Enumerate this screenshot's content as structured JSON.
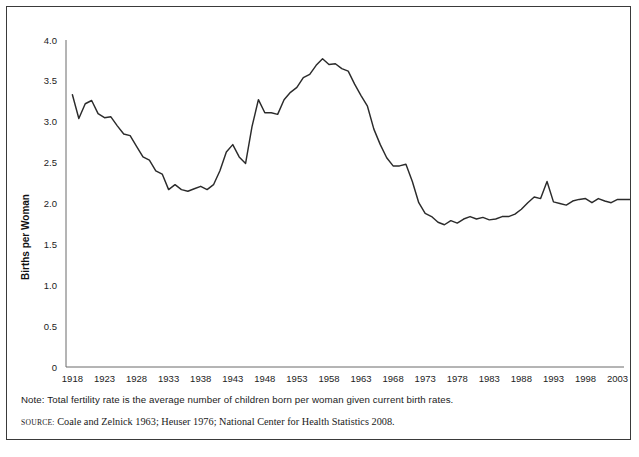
{
  "chart_data": {
    "type": "line",
    "title": "",
    "xlabel": "",
    "ylabel": "Births per Woman",
    "xlim": [
      1917,
      2004
    ],
    "ylim": [
      0,
      4.0
    ],
    "grid": false,
    "legend": "none",
    "y_ticks": [
      "0",
      "0.5",
      "1.0",
      "1.5",
      "2.0",
      "2.5",
      "3.0",
      "3.5",
      "4.0"
    ],
    "y_tick_values": [
      0,
      0.5,
      1.0,
      1.5,
      2.0,
      2.5,
      3.0,
      3.5,
      4.0
    ],
    "x_ticks": [
      "1918",
      "1923",
      "1928",
      "1933",
      "1938",
      "1943",
      "1948",
      "1953",
      "1958",
      "1963",
      "1968",
      "1973",
      "1978",
      "1983",
      "1988",
      "1993",
      "1998",
      "2003"
    ],
    "x_tick_values": [
      1918,
      1923,
      1928,
      1933,
      1938,
      1943,
      1948,
      1953,
      1958,
      1963,
      1968,
      1973,
      1978,
      1983,
      1988,
      1993,
      1998,
      2003
    ],
    "series": [
      {
        "name": "Total fertility rate",
        "color": "#2b2b2b",
        "x": [
          1918,
          1919,
          1920,
          1921,
          1922,
          1923,
          1924,
          1925,
          1926,
          1927,
          1928,
          1929,
          1930,
          1931,
          1932,
          1933,
          1934,
          1935,
          1936,
          1937,
          1938,
          1939,
          1940,
          1941,
          1942,
          1943,
          1944,
          1945,
          1946,
          1947,
          1948,
          1949,
          1950,
          1951,
          1952,
          1953,
          1954,
          1955,
          1956,
          1957,
          1958,
          1959,
          1960,
          1961,
          1962,
          1963,
          1964,
          1965,
          1966,
          1967,
          1968,
          1969,
          1970,
          1971,
          1972,
          1973,
          1974,
          1975,
          1976,
          1977,
          1978,
          1979,
          1980,
          1981,
          1982,
          1983,
          1984,
          1985,
          1986,
          1987,
          1988,
          1989,
          1990,
          1991,
          1992,
          1993,
          1994,
          1995,
          1996,
          1997,
          1998,
          1999,
          2000,
          2001,
          2002,
          2003,
          2004,
          2005
        ],
        "values": [
          3.33,
          3.04,
          3.22,
          3.26,
          3.1,
          3.05,
          3.06,
          2.95,
          2.85,
          2.83,
          2.7,
          2.57,
          2.53,
          2.4,
          2.36,
          2.17,
          2.23,
          2.17,
          2.15,
          2.18,
          2.21,
          2.17,
          2.23,
          2.4,
          2.63,
          2.72,
          2.57,
          2.49,
          2.94,
          3.27,
          3.11,
          3.11,
          3.09,
          3.27,
          3.36,
          3.42,
          3.54,
          3.58,
          3.69,
          3.77,
          3.7,
          3.71,
          3.65,
          3.62,
          3.46,
          3.32,
          3.19,
          2.91,
          2.72,
          2.56,
          2.46,
          2.46,
          2.48,
          2.27,
          2.01,
          1.88,
          1.84,
          1.77,
          1.74,
          1.79,
          1.76,
          1.81,
          1.84,
          1.81,
          1.83,
          1.8,
          1.81,
          1.84,
          1.84,
          1.87,
          1.93,
          2.01,
          2.08,
          2.06,
          2.27,
          2.02,
          2.0,
          1.98,
          2.03,
          2.05,
          2.06,
          2.01,
          2.06,
          2.03,
          2.01,
          2.05,
          2.05,
          2.05
        ]
      }
    ]
  },
  "footnotes": {
    "note": "Note: Total fertility rate is the average number of children born per woman given current birth rates.",
    "source_label": "Source:",
    "source_text": "Coale and Zelnick 1963; Heuser 1976; National Center for Health Statistics 2008."
  },
  "colors": {
    "line": "#2b2b2b",
    "axis": "#6a6a6a",
    "frame": "#3a3a3a",
    "text": "#1a1a1a"
  }
}
